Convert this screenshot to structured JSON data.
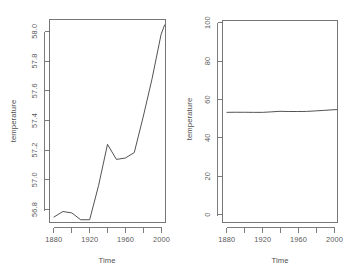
{
  "figure": {
    "title": "",
    "layout": "1 row x 2 columns",
    "background_color": "#ffffff",
    "line_color": "#4a4a4a",
    "axis_color": "#6e6e6e",
    "text_color": "#5a5a5a"
  },
  "chart_data": [
    {
      "type": "line",
      "panel": "left",
      "title": "",
      "xlabel": "Time",
      "ylabel": "temperature",
      "xlim": [
        1875,
        2005
      ],
      "ylim": [
        56.68,
        58.16
      ],
      "xticks": [
        1880,
        1920,
        1960,
        2000
      ],
      "xtick_labels": [
        "1880",
        "1920",
        "1960",
        "2000"
      ],
      "xminor_ticks": [
        1900,
        1940,
        1980
      ],
      "yticks": [
        56.8,
        57.0,
        57.2,
        57.4,
        57.6,
        57.8,
        58.0
      ],
      "ytick_labels": [
        "56.8",
        "57.0",
        "57.2",
        "57.4",
        "57.6",
        "57.8",
        "58.0"
      ],
      "grid": false,
      "legend": null,
      "x": [
        1880,
        1890,
        1900,
        1910,
        1920,
        1930,
        1940,
        1950,
        1960,
        1970,
        1980,
        1990,
        2000,
        2004
      ],
      "values": [
        56.72,
        56.76,
        56.75,
        56.7,
        56.7,
        56.95,
        57.25,
        57.14,
        57.15,
        57.19,
        57.45,
        57.73,
        58.05,
        58.12
      ],
      "series": [
        {
          "name": "temperature",
          "values": [
            56.72,
            56.76,
            56.75,
            56.7,
            56.7,
            56.95,
            57.25,
            57.14,
            57.15,
            57.19,
            57.45,
            57.73,
            58.05,
            58.12
          ]
        }
      ]
    },
    {
      "type": "line",
      "panel": "right",
      "title": "",
      "xlabel": "Time",
      "ylabel": "temperature",
      "xlim": [
        1875,
        2005
      ],
      "ylim": [
        0,
        104
      ],
      "xticks": [
        1880,
        1920,
        1960,
        2000
      ],
      "xtick_labels": [
        "1880",
        "1920",
        "1960",
        "2000"
      ],
      "xminor_ticks": [
        1900,
        1940,
        1980
      ],
      "yticks": [
        0,
        20,
        40,
        60,
        80,
        100
      ],
      "ytick_labels": [
        "0",
        "20",
        "40",
        "60",
        "80",
        "100"
      ],
      "grid": false,
      "legend": null,
      "x": [
        1880,
        1890,
        1900,
        1910,
        1920,
        1930,
        1940,
        1950,
        1960,
        1970,
        1980,
        1990,
        2000,
        2004
      ],
      "values": [
        56.72,
        56.76,
        56.75,
        56.7,
        56.7,
        56.95,
        57.25,
        57.14,
        57.15,
        57.19,
        57.45,
        57.73,
        58.05,
        58.12
      ],
      "series": [
        {
          "name": "temperature",
          "values": [
            56.72,
            56.76,
            56.75,
            56.7,
            56.7,
            56.95,
            57.25,
            57.14,
            57.15,
            57.19,
            57.45,
            57.73,
            58.05,
            58.12
          ]
        }
      ]
    }
  ]
}
